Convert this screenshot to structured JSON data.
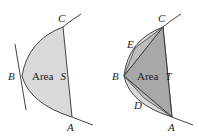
{
  "diagrams": [
    {
      "id": "left",
      "area_label": "Area",
      "area_var": "S",
      "points": {
        "A": "A",
        "B": "B",
        "C": "C"
      },
      "fill_color": "#d9d9d9"
    },
    {
      "id": "right",
      "area_label": "Area",
      "area_var": "T",
      "points": {
        "A": "A",
        "B": "B",
        "C": "C",
        "D": "D",
        "E": "E"
      },
      "fill_color": "#a8a8a8",
      "light_fill_color": "#d9d9d9"
    }
  ]
}
